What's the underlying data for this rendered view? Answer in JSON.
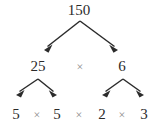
{
  "diagram": {
    "type": "factor-tree",
    "title_number": "150",
    "levels": [
      {
        "level": 1,
        "nodes": [
          {
            "label": "150",
            "x": 79,
            "y": 10,
            "kind": "number"
          }
        ]
      },
      {
        "level": 2,
        "nodes": [
          {
            "label": "25",
            "x": 38,
            "y": 66,
            "kind": "number"
          },
          {
            "label": "×",
            "x": 80,
            "y": 67,
            "kind": "operator"
          },
          {
            "label": "6",
            "x": 122,
            "y": 66,
            "kind": "number"
          }
        ]
      },
      {
        "level": 3,
        "nodes": [
          {
            "label": "5",
            "x": 16,
            "y": 114,
            "kind": "number"
          },
          {
            "label": "×",
            "x": 37,
            "y": 115,
            "kind": "operator"
          },
          {
            "label": "5",
            "x": 57,
            "y": 114,
            "kind": "number"
          },
          {
            "label": "×",
            "x": 79,
            "y": 115,
            "kind": "operator"
          },
          {
            "label": "2",
            "x": 102,
            "y": 114,
            "kind": "number"
          },
          {
            "label": "×",
            "x": 122,
            "y": 115,
            "kind": "operator"
          },
          {
            "label": "3",
            "x": 144,
            "y": 114,
            "kind": "number"
          }
        ]
      }
    ],
    "branches": [
      {
        "name": "root-to-25",
        "apex_x": 80,
        "apex_y": 21,
        "tip_x": 44,
        "tip_y": 50
      },
      {
        "name": "root-to-6",
        "apex_x": 80,
        "apex_y": 21,
        "tip_x": 118,
        "tip_y": 50
      },
      {
        "name": "25-to-left-5",
        "apex_x": 38,
        "apex_y": 79,
        "tip_x": 16,
        "tip_y": 95
      },
      {
        "name": "25-to-right-5",
        "apex_x": 38,
        "apex_y": 79,
        "tip_x": 57,
        "tip_y": 95
      },
      {
        "name": "6-to-2",
        "apex_x": 123,
        "apex_y": 79,
        "tip_x": 102,
        "tip_y": 95
      },
      {
        "name": "6-to-3",
        "apex_x": 123,
        "apex_y": 79,
        "tip_x": 144,
        "tip_y": 95
      }
    ],
    "colors": {
      "background": "#ffffff",
      "number_text": "#2b2b2b",
      "operator_text": "#8d8d8d",
      "arrow": "#2b2b2b"
    }
  }
}
